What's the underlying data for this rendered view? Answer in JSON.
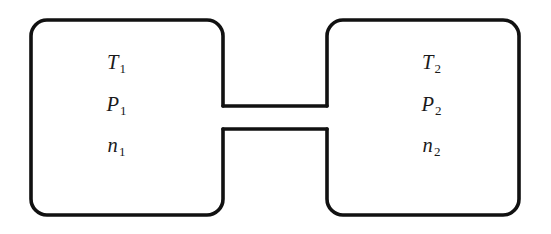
{
  "figure": {
    "kind": "two-chamber-connected-vessel-diagram",
    "background_color": "#ffffff",
    "line_color": "#111111",
    "line_width_px": 3.6,
    "canvas": {
      "width": 551,
      "height": 234
    }
  },
  "chambers": [
    {
      "id": "left",
      "name": "left-chamber",
      "corner_radius_px": 16,
      "bounds": {
        "x": 31,
        "y": 20,
        "width": 192,
        "height": 195
      },
      "labels": [
        {
          "symbol": "T",
          "subscript": "1",
          "meaning": "temperature"
        },
        {
          "symbol": "P",
          "subscript": "1",
          "meaning": "pressure"
        },
        {
          "symbol": "n",
          "subscript": "1",
          "meaning": "moles"
        }
      ]
    },
    {
      "id": "right",
      "name": "right-chamber",
      "corner_radius_px": 16,
      "bounds": {
        "x": 327,
        "y": 20,
        "width": 192,
        "height": 195
      },
      "labels": [
        {
          "symbol": "T",
          "subscript": "2",
          "meaning": "temperature"
        },
        {
          "symbol": "P",
          "subscript": "2",
          "meaning": "pressure"
        },
        {
          "symbol": "n",
          "subscript": "2",
          "meaning": "moles"
        }
      ]
    }
  ],
  "connector": {
    "name": "connecting-tube",
    "x_start": 223,
    "x_end": 327,
    "y_top": 106,
    "y_bottom": 129
  }
}
